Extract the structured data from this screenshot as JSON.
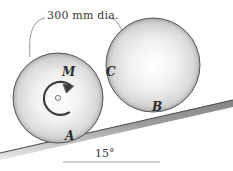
{
  "figure": {
    "type": "engineering-statics-diagram",
    "background_color": "#ffffff",
    "line_color": "#4a4a4a",
    "label_color": "#2b2b2b"
  },
  "dimension": {
    "text": "300 mm dia.",
    "value": 300,
    "unit": "mm",
    "quantity": "diameter"
  },
  "angle": {
    "text": "15°",
    "value": 15,
    "unit": "degrees"
  },
  "labels": {
    "moment": "M",
    "contact_lower_incline": "A",
    "contact_upper_incline": "B",
    "contact_between_cylinders": "C"
  },
  "cylinders": [
    {
      "id": "lower-cylinder",
      "center_x": 58,
      "center_y": 98,
      "radius": 45,
      "label": "A",
      "has_moment": true
    },
    {
      "id": "upper-cylinder",
      "center_x": 153,
      "center_y": 65,
      "radius": 47,
      "label": "B",
      "has_moment": false
    }
  ],
  "incline": {
    "start_x": 0,
    "start_y": 153,
    "end_x": 233,
    "end_y": 100,
    "angle_degrees": 15
  },
  "reference_line": {
    "start_x": 63,
    "start_y": 162,
    "end_x": 160,
    "end_y": 162
  },
  "colors": {
    "metal_light": "#fefefe",
    "metal_mid": "#d8d8d8",
    "metal_dark": "#9a9a9a",
    "outline": "#555555",
    "text": "#2b2b2b"
  }
}
